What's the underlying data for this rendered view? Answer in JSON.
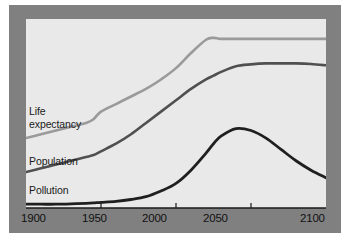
{
  "figure": {
    "frame_color": "#808080",
    "panel_color": "#e9e9e9",
    "axis_color": "#1a1a1a"
  },
  "chart_data": {
    "type": "line",
    "title": "",
    "subtitle": "",
    "xlabel": "",
    "ylabel": "",
    "grid": false,
    "legend_position": "inline-left",
    "xlim": [
      1900,
      2100
    ],
    "ylim": [
      0,
      100
    ],
    "xticks": [
      1900,
      1950,
      2000,
      2050,
      2100
    ],
    "xtick_labels": [
      "1900",
      "1950",
      "2000",
      "2050",
      "2100"
    ],
    "yticks": [],
    "ytick_labels": [],
    "x": [
      1900,
      1910,
      1920,
      1930,
      1940,
      1945,
      1950,
      1960,
      1970,
      1980,
      1990,
      2000,
      2010,
      2020,
      2025,
      2030,
      2040,
      2050,
      2060,
      2070,
      2080,
      2090,
      2100
    ],
    "series": [
      {
        "name": "Life expectancy",
        "label": "Life\nexpectancy",
        "color": "#9a9a9a",
        "width": 2.6,
        "values": [
          37,
          39,
          41,
          43,
          45,
          47,
          51,
          55,
          59,
          63,
          68,
          74,
          82,
          89,
          90,
          89.5,
          89.5,
          89.5,
          89.5,
          89.5,
          89.5,
          89.5,
          89.5
        ]
      },
      {
        "name": "Population",
        "label": "Population",
        "color": "#505050",
        "width": 2.6,
        "values": [
          19,
          21,
          23,
          25,
          27,
          28,
          30,
          34,
          39,
          45,
          51,
          57,
          63,
          68,
          70,
          72,
          75,
          76,
          76.5,
          76.5,
          76.5,
          76.2,
          75.5
        ]
      },
      {
        "name": "Pollution",
        "label": "Pollution",
        "color": "#1f1f1f",
        "width": 2.8,
        "values": [
          2,
          2,
          2,
          2.2,
          2.5,
          2.7,
          3,
          3.5,
          4.5,
          6,
          9,
          13,
          20,
          29,
          34,
          38,
          42,
          41,
          37,
          31,
          25,
          20,
          16
        ]
      }
    ]
  },
  "axis_labels": {
    "x_ticks": [
      "1900",
      "1950",
      "2000",
      "2050",
      "2100"
    ]
  }
}
